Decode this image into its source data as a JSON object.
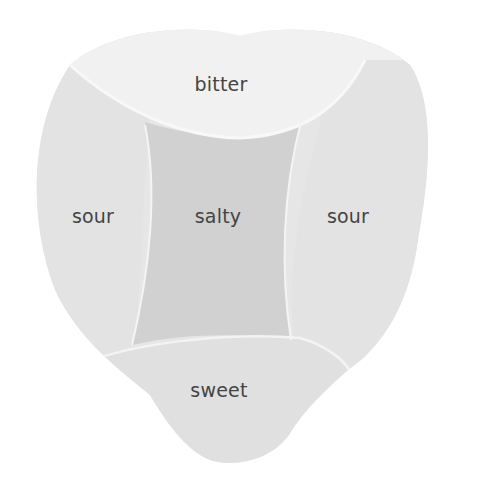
{
  "diagram": {
    "colors": {
      "background": "#ffffff",
      "tongue_base": "#e6e6e6",
      "bitter": "#f1f1f1",
      "sour": "#e4e4e4",
      "salty": "#d2d2d2",
      "sweet": "#e0e0e0",
      "edge_highlight": "#f7f7f7",
      "text": "#444444"
    },
    "regions": [
      {
        "id": "bitter",
        "label": "bitter",
        "position": "back"
      },
      {
        "id": "sour-left",
        "label": "sour",
        "position": "left side"
      },
      {
        "id": "salty",
        "label": "salty",
        "position": "center"
      },
      {
        "id": "sour-right",
        "label": "sour",
        "position": "right side"
      },
      {
        "id": "sweet",
        "label": "sweet",
        "position": "tip"
      }
    ]
  }
}
